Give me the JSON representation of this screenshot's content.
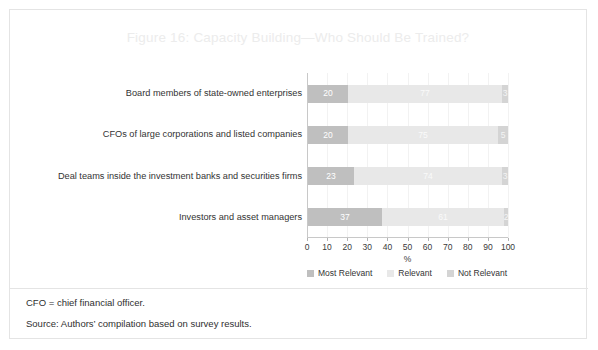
{
  "figure": {
    "title": "Figure 16: Capacity Building—Who Should Be Trained?",
    "title_color": "#ececec",
    "border_color": "#e4e4e4",
    "background": "#ffffff"
  },
  "footnotes": [
    "CFO = chief financial officer.",
    "Source: Authors’ compilation based on survey results."
  ],
  "legend": {
    "position": "bottom",
    "items": [
      {
        "label": "Most Relevant",
        "color": "#bfbfbf"
      },
      {
        "label": "Relevant",
        "color": "#e8e8e8"
      },
      {
        "label": "Not Relevant",
        "color": "#d4d4d4"
      }
    ]
  },
  "axis": {
    "x_title": "%",
    "x_ticks": [
      "0",
      "10",
      "20",
      "30",
      "40",
      "50",
      "60",
      "70",
      "80",
      "90",
      "100"
    ],
    "x_min": 0,
    "x_max": 100
  },
  "chart_data": {
    "type": "bar",
    "orientation": "horizontal",
    "stacked": true,
    "stack_total": 100,
    "title": "Figure 16: Capacity Building—Who Should Be Trained?",
    "xlabel": "%",
    "ylabel": "",
    "xlim": [
      0,
      100
    ],
    "grid": true,
    "grid_axis": "x",
    "legend_position": "bottom",
    "categories": [
      "Board members of state-owned enterprises",
      "CFOs of large corporations and listed companies",
      "Deal teams inside the investment banks and securities firms",
      "Investors and asset managers"
    ],
    "series": [
      {
        "name": "Most Relevant",
        "color": "#bfbfbf",
        "values": [
          20,
          20,
          23,
          37
        ]
      },
      {
        "name": "Relevant",
        "color": "#e8e8e8",
        "values": [
          77,
          75,
          74,
          61
        ]
      },
      {
        "name": "Not Relevant",
        "color": "#d4d4d4",
        "values": [
          3,
          5,
          3,
          2
        ]
      }
    ]
  }
}
